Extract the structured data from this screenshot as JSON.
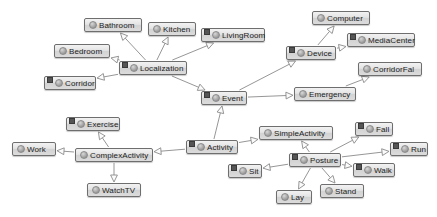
{
  "diagram": {
    "type": "uml-class-generalization",
    "canvas": {
      "width": 437,
      "height": 217,
      "background": "#ffffff"
    },
    "style": {
      "node_border": "#6e6e6e",
      "node_fill": "#e4e4e4",
      "edge_color": "#8a8a8a",
      "label_color": "#1d1d1d",
      "abstract_mark_color": "#555555"
    },
    "icon_names": {
      "class": "class-circle-icon",
      "abstract": "abstract-square-icon",
      "generalization": "hollow-triangle-arrow-icon"
    },
    "nodes": [
      {
        "id": "bathroom",
        "label": "Bathroom",
        "x": 84,
        "y": 18,
        "w": 58,
        "abstract": false
      },
      {
        "id": "kitchen",
        "label": "Kitchen",
        "x": 148,
        "y": 22,
        "w": 48,
        "abstract": false
      },
      {
        "id": "livingroom",
        "label": "LivingRoom",
        "x": 201,
        "y": 28,
        "w": 64,
        "abstract": true
      },
      {
        "id": "bedroom",
        "label": "Bedroom",
        "x": 54,
        "y": 44,
        "w": 56,
        "abstract": false
      },
      {
        "id": "corridor",
        "label": "Corridor",
        "x": 44,
        "y": 76,
        "w": 52,
        "abstract": true
      },
      {
        "id": "localization",
        "label": "Localization",
        "x": 119,
        "y": 61,
        "w": 68,
        "abstract": true
      },
      {
        "id": "event",
        "label": "Event",
        "x": 201,
        "y": 91,
        "w": 46,
        "abstract": true
      },
      {
        "id": "computer",
        "label": "Computer",
        "x": 312,
        "y": 11,
        "w": 58,
        "abstract": false
      },
      {
        "id": "mediacenter",
        "label": "MediaCenter",
        "x": 347,
        "y": 33,
        "w": 68,
        "abstract": true
      },
      {
        "id": "device",
        "label": "Device",
        "x": 286,
        "y": 46,
        "w": 50,
        "abstract": true
      },
      {
        "id": "corridorfal",
        "label": "CorridorFal",
        "x": 358,
        "y": 62,
        "w": 64,
        "abstract": false
      },
      {
        "id": "emergency",
        "label": "Emergency",
        "x": 294,
        "y": 87,
        "w": 62,
        "abstract": false
      },
      {
        "id": "exercise",
        "label": "Exercise",
        "x": 66,
        "y": 117,
        "w": 54,
        "abstract": true
      },
      {
        "id": "work",
        "label": "Work",
        "x": 12,
        "y": 142,
        "w": 44,
        "abstract": false
      },
      {
        "id": "complexactivity",
        "label": "ComplexActivity",
        "x": 75,
        "y": 148,
        "w": 78,
        "abstract": false
      },
      {
        "id": "watchtv",
        "label": "WatchTV",
        "x": 87,
        "y": 183,
        "w": 54,
        "abstract": false
      },
      {
        "id": "activity",
        "label": "Activity",
        "x": 186,
        "y": 140,
        "w": 52,
        "abstract": true
      },
      {
        "id": "simpleactivity",
        "label": "SimpleActivity",
        "x": 259,
        "y": 126,
        "w": 74,
        "abstract": false
      },
      {
        "id": "sit",
        "label": "Sit",
        "x": 228,
        "y": 164,
        "w": 34,
        "abstract": true
      },
      {
        "id": "posture",
        "label": "Posture",
        "x": 289,
        "y": 153,
        "w": 52,
        "abstract": true
      },
      {
        "id": "fall",
        "label": "Fall",
        "x": 355,
        "y": 122,
        "w": 38,
        "abstract": true
      },
      {
        "id": "run",
        "label": "Run",
        "x": 390,
        "y": 142,
        "w": 38,
        "abstract": true
      },
      {
        "id": "walk",
        "label": "Walk",
        "x": 353,
        "y": 163,
        "w": 42,
        "abstract": true
      },
      {
        "id": "lay",
        "label": "Lay",
        "x": 276,
        "y": 190,
        "w": 36,
        "abstract": false
      },
      {
        "id": "stand",
        "label": "Stand",
        "x": 320,
        "y": 184,
        "w": 44,
        "abstract": false
      }
    ],
    "edges": [
      {
        "from": "localization",
        "to": "bathroom"
      },
      {
        "from": "localization",
        "to": "kitchen"
      },
      {
        "from": "localization",
        "to": "livingroom"
      },
      {
        "from": "localization",
        "to": "bedroom"
      },
      {
        "from": "localization",
        "to": "corridor"
      },
      {
        "from": "localization",
        "to": "event"
      },
      {
        "from": "device",
        "to": "computer"
      },
      {
        "from": "device",
        "to": "mediacenter"
      },
      {
        "from": "event",
        "to": "device"
      },
      {
        "from": "event",
        "to": "emergency"
      },
      {
        "from": "emergency",
        "to": "corridorfal"
      },
      {
        "from": "activity",
        "to": "event"
      },
      {
        "from": "activity",
        "to": "complexactivity"
      },
      {
        "from": "activity",
        "to": "simpleactivity"
      },
      {
        "from": "complexactivity",
        "to": "exercise"
      },
      {
        "from": "complexactivity",
        "to": "work"
      },
      {
        "from": "complexactivity",
        "to": "watchtv"
      },
      {
        "from": "posture",
        "to": "simpleactivity"
      },
      {
        "from": "posture",
        "to": "fall"
      },
      {
        "from": "posture",
        "to": "run"
      },
      {
        "from": "posture",
        "to": "walk"
      },
      {
        "from": "posture",
        "to": "sit"
      },
      {
        "from": "posture",
        "to": "lay"
      },
      {
        "from": "posture",
        "to": "stand"
      }
    ]
  }
}
